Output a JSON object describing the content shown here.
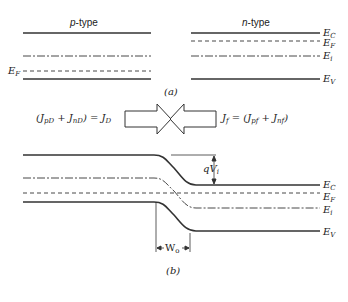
{
  "figure": {
    "part_a": {
      "caption": "(a)",
      "p_side": {
        "title_italic": "p",
        "title_rest": "-type",
        "fermi_label": "E",
        "fermi_sub": "F"
      },
      "n_side": {
        "title_italic": "n",
        "title_rest": "-type",
        "labels": [
          {
            "main": "E",
            "sub": "C"
          },
          {
            "main": "E",
            "sub": "F"
          },
          {
            "main": "E",
            "sub": "i"
          },
          {
            "main": "E",
            "sub": "V"
          }
        ]
      }
    },
    "currents": {
      "left_text": "(J",
      "left_eq": "(J_pD + J_nD) = J_D",
      "right_eq": "J_f = (J_pf + J_nf)",
      "left_parts": [
        "(J",
        "pD",
        " + J",
        "nD",
        ") = J",
        "D"
      ],
      "right_parts": [
        "J",
        "f",
        " = (J",
        "pf",
        " + J",
        "nf",
        ")"
      ]
    },
    "part_b": {
      "caption": "(b)",
      "barrier_label": "qV",
      "barrier_sub": "i",
      "width_label": "W",
      "width_sub": "o",
      "labels": [
        {
          "main": "E",
          "sub": "C"
        },
        {
          "main": "E",
          "sub": "F"
        },
        {
          "main": "E",
          "sub": "i"
        },
        {
          "main": "E",
          "sub": "V"
        }
      ]
    }
  }
}
